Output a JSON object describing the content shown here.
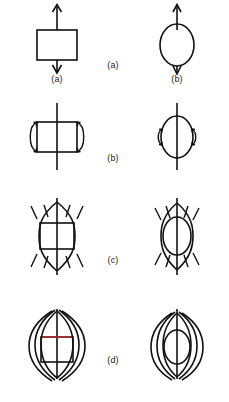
{
  "figure": {
    "title": "",
    "background_color": "#ffffff",
    "line_color": "#111111",
    "accent_color": "#b03030",
    "width": 229,
    "height": 402,
    "rows": [
      {
        "center_label": "(a)",
        "left": {
          "shape": "rectangle",
          "sub_label": "(a)",
          "decorations": "up-arrow-above, down-arrow-below"
        },
        "right": {
          "shape": "ellipse",
          "sub_label": "(b)",
          "decorations": "up-arrow-above, down-arrow-below"
        }
      },
      {
        "center_label": "(b)",
        "left": {
          "shape": "rectangle",
          "sub_label": "",
          "decorations": "vertical-line-through, two-side-arcs-with-arrowheads"
        },
        "right": {
          "shape": "ellipse",
          "sub_label": "",
          "decorations": "vertical-line-through, two-side-arcs-with-arrowheads"
        }
      },
      {
        "center_label": "(c)",
        "left": {
          "shape": "rectangle",
          "sub_label": "",
          "decorations": "vertical-line-through, lens-arcs, four-corner-dashes"
        },
        "right": {
          "shape": "ellipse",
          "sub_label": "",
          "decorations": "vertical-line-through, lens-arcs, four-corner-dashes"
        }
      },
      {
        "center_label": "(d)",
        "left": {
          "shape": "rectangle",
          "sub_label": "",
          "decorations": "vertical-line-through, three-nested-arcs-per-side, red-top-edge"
        },
        "right": {
          "shape": "ellipse",
          "sub_label": "",
          "decorations": "vertical-line-through, three-nested-arcs-per-side"
        }
      }
    ]
  }
}
